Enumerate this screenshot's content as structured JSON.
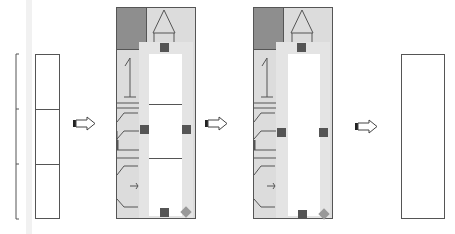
{
  "diagram": {
    "title": "",
    "stages": [
      {
        "id": "stage-1",
        "label": "",
        "description": "Tall narrow rectangle divided into three stacked cells with a bracket on its left side"
      },
      {
        "id": "stage-2",
        "label": "",
        "description": "Gray schematic panel with dark top-left block, triangle symbol, numeral-like glyph and bracket curves, overlaid by a light gray selection frame with three stacked white cells, square handles and a diamond corner handle"
      },
      {
        "id": "stage-3",
        "label": "",
        "description": "Same gray schematic panel with selection frame, inner white area undivided"
      },
      {
        "id": "stage-4",
        "label": "",
        "description": "Single empty tall rectangle"
      }
    ],
    "arrows": [
      {
        "from": "stage-1",
        "to": "stage-2"
      },
      {
        "from": "stage-2",
        "to": "stage-3"
      },
      {
        "from": "stage-3",
        "to": "stage-4"
      }
    ],
    "colors": {
      "outline": "#555555",
      "panel_fill": "#d9d9d9",
      "dark_block": "#8c8c8c",
      "frame": "#e3e3e3",
      "handle": "#555555",
      "diamond_handle": "#999999",
      "background": "#ffffff"
    }
  }
}
